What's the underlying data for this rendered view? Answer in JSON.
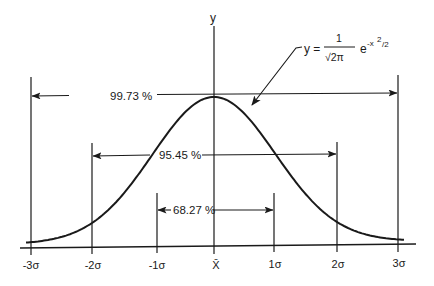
{
  "diagram": {
    "type": "normal-distribution",
    "y_axis_label": "y",
    "formula": {
      "lhs": "y =",
      "numerator": "1",
      "denominator": "√2π",
      "base": "e",
      "exponent": "-x",
      "exponent_power": "2",
      "exponent_divisor": "/2"
    },
    "x_ticks": [
      {
        "label": "-3σ",
        "x": 31
      },
      {
        "label": "-2σ",
        "x": 92
      },
      {
        "label": "-1σ",
        "x": 157
      },
      {
        "label": "X̄",
        "x": 214
      },
      {
        "label": "1σ",
        "x": 274
      },
      {
        "label": "2σ",
        "x": 337
      },
      {
        "label": "3σ",
        "x": 398
      }
    ],
    "ranges": [
      {
        "label": "99.73 %",
        "from": "-3σ",
        "to": "3σ"
      },
      {
        "label": "95.45 %",
        "from": "-2σ",
        "to": "2σ"
      },
      {
        "label": "68.27 %",
        "from": "-1σ",
        "to": "1σ"
      }
    ],
    "colors": {
      "ink": "#1a1a1a",
      "background": "#ffffff"
    }
  }
}
